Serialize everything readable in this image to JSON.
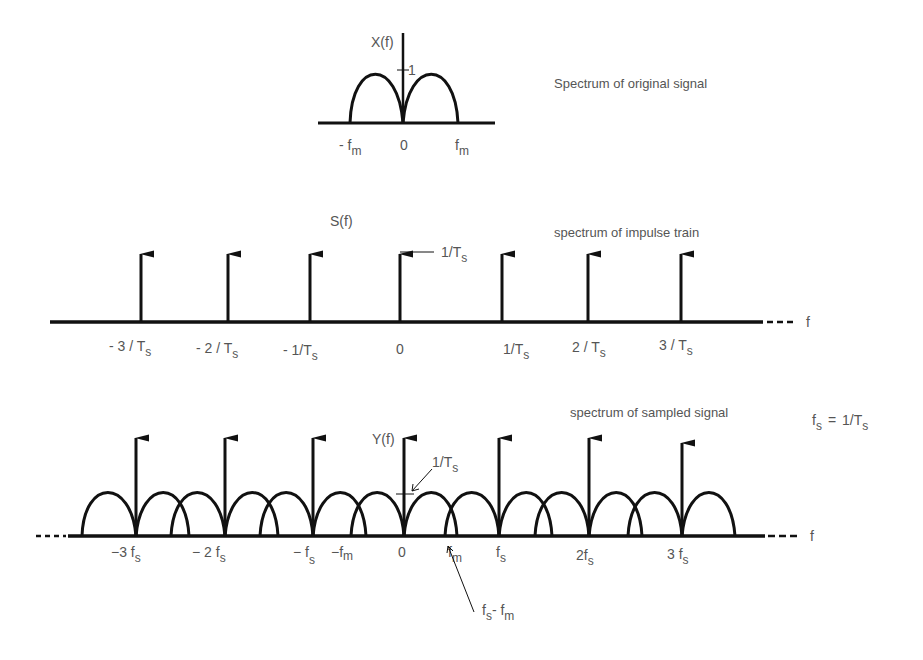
{
  "panels": {
    "original": {
      "caption": "Spectrum of original signal",
      "y_axis_label": "X(f)",
      "peak_tick_label": "1",
      "x_labels": [
        {
          "main": "- f",
          "sub": "m"
        },
        {
          "main": "0",
          "sub": ""
        },
        {
          "main": "f",
          "sub": "m"
        }
      ]
    },
    "impulse_train": {
      "caption": "spectrum of impulse train",
      "y_axis_label": "S(f)",
      "height_label": {
        "main": "1/T",
        "sub": "s"
      },
      "axis_end_label": "f",
      "x_labels": [
        {
          "main": "- 3 / T",
          "sub": "s"
        },
        {
          "main": "- 2 / T",
          "sub": "s"
        },
        {
          "main": "- 1/T",
          "sub": "s"
        },
        {
          "main": "0",
          "sub": ""
        },
        {
          "main": "1/T",
          "sub": "s"
        },
        {
          "main": "2 / T",
          "sub": "s"
        },
        {
          "main": "3 / T",
          "sub": "s"
        }
      ]
    },
    "sampled": {
      "caption": "spectrum of sampled signal",
      "y_axis_label": "Y(f)",
      "height_label": {
        "main": "1/T",
        "sub": "s"
      },
      "axis_end_label": "f",
      "x_labels": [
        {
          "main": "−3 f",
          "sub": "s"
        },
        {
          "main": "− 2 f",
          "sub": "s"
        },
        {
          "main": "− f",
          "sub": "s"
        },
        {
          "main": "−f",
          "sub": "m"
        },
        {
          "main": "0",
          "sub": ""
        },
        {
          "main": "f",
          "sub": "m"
        },
        {
          "main": "f",
          "sub": "s"
        },
        {
          "main": "2f",
          "sub": "s"
        },
        {
          "main": "3 f",
          "sub": "s"
        }
      ],
      "annotation": {
        "main1": "f",
        "sub1": "s",
        "main2": "- f",
        "sub2": "m"
      }
    },
    "relation": {
      "lhs_main": "f",
      "lhs_sub": "s",
      "eq": "=",
      "rhs_main": "1/T",
      "rhs_sub": "s"
    }
  }
}
